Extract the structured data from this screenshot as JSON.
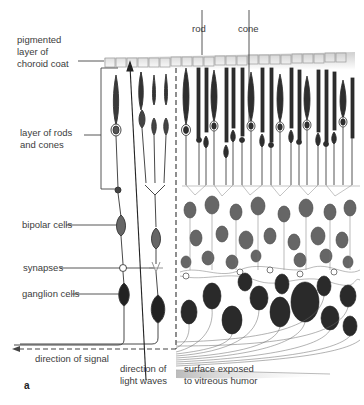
{
  "figure": {
    "panel_label": "a",
    "labels": {
      "pigmented_layer": "pigmented\nlayer of\nchoroid coat",
      "rods_cones_layer": "layer of rods\nand cones",
      "bipolar": "bipolar cells",
      "synapses": "synapses",
      "ganglion": "ganglion cells",
      "signal": "direction of signal",
      "light": "direction of\nlight waves",
      "surface": "surface exposed\nto vitreous humor",
      "rod": "rod",
      "cone": "cone"
    },
    "colors": {
      "ink": "#2e2e2e",
      "cell_fill": "#555555",
      "bipolar_fill": "#6a6a6a",
      "line": "#555555",
      "surface_shade": "#d8d8d8"
    }
  }
}
